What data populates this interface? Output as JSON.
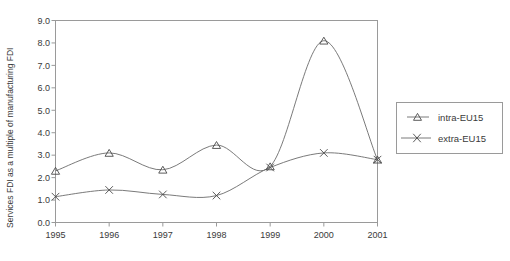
{
  "chart_data": {
    "type": "line",
    "title": "",
    "xlabel": "",
    "ylabel": "Services FDI as a multiple of manufacturing FDI",
    "categories": [
      "1995",
      "1996",
      "1997",
      "1998",
      "1999",
      "2000",
      "2001"
    ],
    "x": [
      1995,
      1996,
      1997,
      1998,
      1999,
      2000,
      2001
    ],
    "xlim": [
      1995,
      2001
    ],
    "ylim": [
      0.0,
      9.0
    ],
    "ytick_labels": [
      "0.0",
      "1.0",
      "2.0",
      "3.0",
      "4.0",
      "5.0",
      "6.0",
      "7.0",
      "8.0",
      "9.0"
    ],
    "ytick_values": [
      0.0,
      1.0,
      2.0,
      3.0,
      4.0,
      5.0,
      6.0,
      7.0,
      8.0,
      9.0
    ],
    "grid": false,
    "legend_position": "right",
    "smoothing": "spline",
    "series": [
      {
        "name": "intra-EU15",
        "marker": "triangle",
        "values": [
          2.3,
          3.1,
          2.35,
          3.45,
          2.5,
          8.1,
          2.8
        ]
      },
      {
        "name": "extra-EU15",
        "marker": "cross",
        "values": [
          1.15,
          1.45,
          1.25,
          1.2,
          2.45,
          3.1,
          2.8
        ]
      }
    ]
  },
  "legend": {
    "entries": [
      {
        "label": "intra-EU15"
      },
      {
        "label": "extra-EU15"
      }
    ]
  },
  "colors": {
    "line": "#6b6b6b",
    "frame": "#9a9a9a",
    "text": "#3a3a3a",
    "background": "#ffffff"
  }
}
